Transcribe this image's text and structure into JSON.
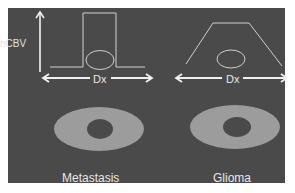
{
  "diagram": {
    "y_axis_label": "nCBV",
    "x_axis_label_left": "Dx",
    "x_axis_label_right": "Dx",
    "captions": {
      "left": "Metastasis",
      "right": "Glioma"
    },
    "colors": {
      "background": "#4a4a4a",
      "lines": "#e0e0e0",
      "ring": "#9c9c9c",
      "core": "#4a4a4a",
      "outer_page": "#ffffff"
    },
    "left_profile": "rectangular (sharp-edged) perfusion profile",
    "right_profile": "trapezoidal (gradually sloping) perfusion profile"
  }
}
